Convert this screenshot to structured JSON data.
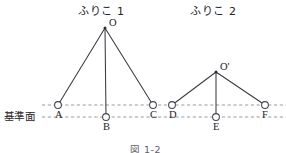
{
  "figure": {
    "caption": "図 1-2",
    "caption_x": 130,
    "caption_y": 145,
    "width": 286,
    "height": 153,
    "background": "#ffffff",
    "line_color": "#3a3a42",
    "dash_color": "#8a8a93",
    "text_color": "#23232a"
  },
  "reference_plane": {
    "label": "基準面",
    "label_x": 4,
    "label_y": 111
  },
  "guide_lines": [
    {
      "name": "upper-dashed-line",
      "x1": 42,
      "y1": 105,
      "x2": 286,
      "y2": 105
    },
    {
      "name": "lower-dashed-line",
      "x1": 42,
      "y1": 117,
      "x2": 286,
      "y2": 117
    }
  ],
  "pendulums": [
    {
      "id": "pendulum-1",
      "title": "ふりこ 1",
      "title_x": 78,
      "title_y": 6,
      "pivot": {
        "label": "O",
        "x": 105,
        "y": 28,
        "label_x": 109,
        "label_y": 18
      },
      "positions": [
        {
          "label": "A",
          "x": 58,
          "y": 105,
          "label_x": 55,
          "label_y": 110
        },
        {
          "label": "B",
          "x": 106,
          "y": 117,
          "label_x": 103,
          "label_y": 122
        },
        {
          "label": "C",
          "x": 153,
          "y": 105,
          "label_x": 150,
          "label_y": 110
        }
      ]
    },
    {
      "id": "pendulum-2",
      "title": "ふりこ 2",
      "title_x": 190,
      "title_y": 6,
      "pivot": {
        "label": "O'",
        "x": 216,
        "y": 72,
        "label_x": 220,
        "label_y": 62
      },
      "positions": [
        {
          "label": "D",
          "x": 172,
          "y": 105,
          "label_x": 169,
          "label_y": 110
        },
        {
          "label": "E",
          "x": 216,
          "y": 117,
          "label_x": 213,
          "label_y": 122
        },
        {
          "label": "F",
          "x": 265,
          "y": 105,
          "label_x": 262,
          "label_y": 110
        }
      ]
    }
  ]
}
